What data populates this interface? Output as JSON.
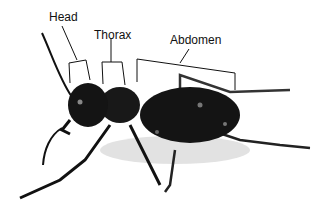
{
  "figure": {
    "labels": [
      {
        "id": "head",
        "text": "Head",
        "x": 49,
        "y": 11
      },
      {
        "id": "thorax",
        "text": "Thorax",
        "x": 94,
        "y": 29
      },
      {
        "id": "abdomen",
        "text": "Abdomen",
        "x": 170,
        "y": 34
      }
    ],
    "colors": {
      "beetle": "#141414",
      "background": "#ffffff",
      "line": "#111111"
    }
  }
}
